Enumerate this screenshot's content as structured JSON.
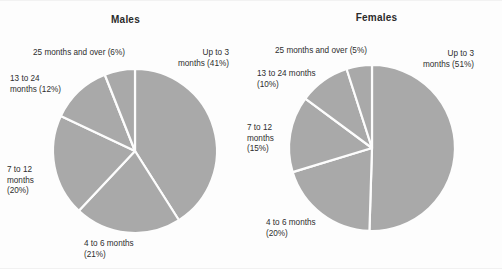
{
  "page": {
    "background_color": "#fdfdfd",
    "text_color": "#2e2e2e",
    "title_color": "#2b2b2b"
  },
  "charts": [
    {
      "id": "males",
      "title": "Males",
      "slice_color": "#a9a9a9",
      "separator_color": "#fdfdfd",
      "labels": {
        "up_to_3": "Up to 3\nmonths (41%)",
        "four_to_6": "4 to 6 months\n(21%)",
        "seven_to_12": "7 to 12\nmonths\n(20%)",
        "thirteen_to_24": "13 to 24\nmonths (12%)",
        "twentyfive_over": "25 months and over (6%)"
      }
    },
    {
      "id": "females",
      "title": "Females",
      "slice_color": "#a9a9a9",
      "separator_color": "#fdfdfd",
      "labels": {
        "up_to_3": "Up to 3\nmonths (51%)",
        "four_to_6": "4 to 6 months\n(20%)",
        "seven_to_12": "7 to 12\nmonths\n(15%)",
        "thirteen_to_24": "13 to 24 months\n(10%)",
        "twentyfive_over": "25 months and over (5%)"
      }
    }
  ],
  "chart_data": [
    {
      "type": "pie",
      "title": "Males",
      "categories": [
        "Up to 3 months",
        "4 to 6 months",
        "7 to 12 months",
        "13 to 24 months",
        "25 months and over"
      ],
      "values": [
        41,
        21,
        20,
        12,
        6
      ],
      "unit": "percent",
      "start_angle_deg": 0,
      "direction": "clockwise",
      "colors": [
        "#a9a9a9",
        "#a9a9a9",
        "#a9a9a9",
        "#a9a9a9",
        "#a9a9a9"
      ],
      "legend": "none",
      "labels_shown": "outside-callouts",
      "center": {
        "x": 135,
        "y": 150
      },
      "radius": 82
    },
    {
      "type": "pie",
      "title": "Females",
      "categories": [
        "Up to 3 months",
        "4 to 6 months",
        "7 to 12 months",
        "13 to 24 months",
        "25 months and over"
      ],
      "values": [
        51,
        20,
        15,
        10,
        5
      ],
      "unit": "percent",
      "start_angle_deg": 0,
      "direction": "clockwise",
      "colors": [
        "#a9a9a9",
        "#a9a9a9",
        "#a9a9a9",
        "#a9a9a9",
        "#a9a9a9"
      ],
      "legend": "none",
      "labels_shown": "outside-callouts",
      "center": {
        "x": 372,
        "y": 147
      },
      "radius": 83
    }
  ]
}
